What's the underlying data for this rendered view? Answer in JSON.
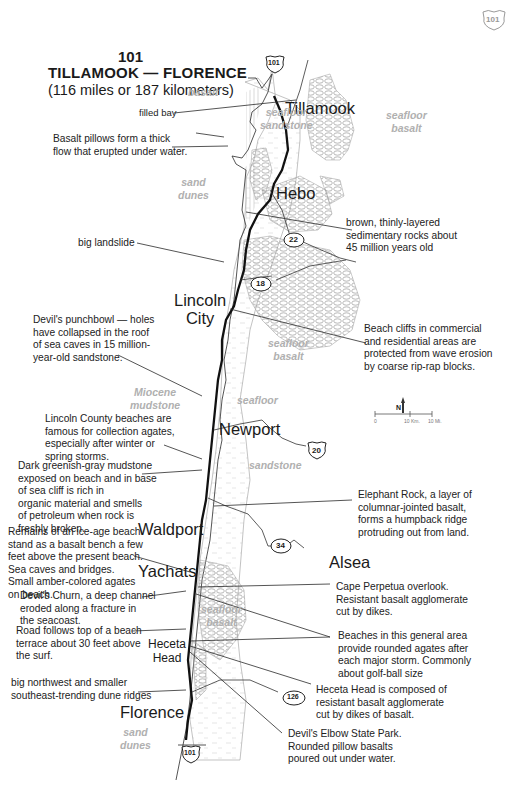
{
  "title": {
    "route": "101",
    "main": "TILLAMOOK — FLORENCE",
    "sub": "(116 miles or 187 kilometers)"
  },
  "corner_shield": {
    "icon": "us-highway-shield-icon",
    "label": "101"
  },
  "towns": [
    {
      "name": "Tillamook"
    },
    {
      "name": "Hebo"
    },
    {
      "name": "Lincoln\nCity"
    },
    {
      "name": "Newport"
    },
    {
      "name": "Waldport"
    },
    {
      "name": "Alsea"
    },
    {
      "name": "Yachats"
    },
    {
      "name": "Heceta\nHead"
    },
    {
      "name": "Florence"
    }
  ],
  "geology_labels": [
    {
      "text": "basalt"
    },
    {
      "text": "seafloor\nsandstone"
    },
    {
      "text": "seafloor\nbasalt"
    },
    {
      "text": "sand\ndunes"
    },
    {
      "text": "seafloor\nbasalt"
    },
    {
      "text": "Miocene\nmudstone"
    },
    {
      "text": "seafloor"
    },
    {
      "text": "sandstone"
    },
    {
      "text": "seafloor\nbasalt"
    },
    {
      "text": "sand\ndunes"
    }
  ],
  "highway_markers": [
    {
      "type": "us-shield",
      "label": "101",
      "position": "north"
    },
    {
      "type": "state-oval",
      "label": "22"
    },
    {
      "type": "state-oval",
      "label": "18"
    },
    {
      "type": "us-shield",
      "label": "20"
    },
    {
      "type": "state-oval",
      "label": "34"
    },
    {
      "type": "state-oval",
      "label": "126"
    },
    {
      "type": "us-shield",
      "label": "101",
      "position": "south"
    }
  ],
  "annotations_left": [
    {
      "text": "filled bay"
    },
    {
      "text": "Basalt pillows form a thick\nflow that erupted under water."
    },
    {
      "text": "big landslide"
    },
    {
      "text": "Devil's punchbowl — holes\nhave collapsed in the roof\nof sea caves in 15 million-\nyear-old sandstone."
    },
    {
      "text": "Lincoln County beaches are\nfamous for collection agates,\nespecially after winter or\nspring storms."
    },
    {
      "text": "Dark greenish-gray mudstone\nexposed on beach and in base\nof sea cliff is rich in\norganic material and smells\nof petroleum when rock is\nfreshly broken."
    },
    {
      "text": "Remains of an ice-age beach\nstand as a basalt bench a few\nfeet above the present beach.\nSea caves and bridges.\nSmall amber-colored agates\non beach."
    },
    {
      "text": "Devil's Churn, a deep channel\neroded along a fracture in\nthe seacoast."
    },
    {
      "text": "Road follows top of a beach\nterrace about 30 feet above\nthe surf."
    },
    {
      "text": "big northwest and smaller\nsoutheast-trending dune ridges"
    }
  ],
  "annotations_right": [
    {
      "text": "brown, thinly-layered\nsedimentary rocks about\n45 million years old"
    },
    {
      "text": "Beach cliffs in commercial\nand residential areas are\nprotected from wave erosion\nby coarse rip-rap blocks."
    },
    {
      "text": "Elephant Rock, a layer of\ncolumnar-jointed basalt,\nforms a humpback ridge\nprotruding out from land."
    },
    {
      "text": "Cape Perpetua overlook.\nResistant basalt agglomerate\ncut by dikes."
    },
    {
      "text": "Beaches in this general area\nprovide rounded agates after\neach major storm. Commonly\nabout golf-ball size"
    },
    {
      "text": "Heceta Head is composed of\nresistant basalt agglomerate\ncut by dikes of basalt."
    },
    {
      "text": "Devil's Elbow State Park.\nRounded pillow basalts\npoured out under water."
    }
  ],
  "legend": {
    "north_arrow": {
      "icon": "north-arrow-icon",
      "label": "N"
    },
    "scale_bar": {
      "ticks": [
        "0",
        "10 Km.",
        "10 Mi."
      ]
    }
  },
  "colors": {
    "ink": "#1a1a1a",
    "geology_text": "#b0b0b0",
    "pattern": "#9a9a9a",
    "background": "#ffffff"
  }
}
